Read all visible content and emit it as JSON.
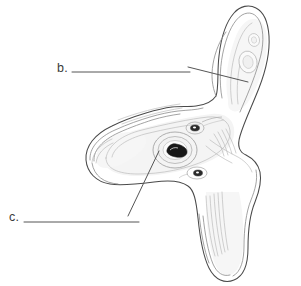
{
  "figure": {
    "type": "line-drawing",
    "background_color": "#ffffff",
    "outline_color": "#4a4a4a",
    "inner_line_color": "#8f8f8f",
    "faint_line_color": "#bdbdbd",
    "shading_color": "#f2f2f2",
    "dark_fill_color": "#1a1a1a",
    "leader_line_color": "#555555",
    "label_text_color": "#3a3a3a"
  },
  "labels": [
    {
      "id": "b",
      "text": "b.",
      "blank_rule": true,
      "rule_x_start": 72,
      "rule_x_end": 190,
      "rule_y": 72,
      "leader_from_x": 188,
      "leader_from_y": 67,
      "leader_to_x": 248,
      "leader_to_y": 82
    },
    {
      "id": "c",
      "text": "c.",
      "blank_rule": true,
      "rule_x_start": 24,
      "rule_x_end": 139,
      "rule_y": 222,
      "leader_from_x": 128,
      "leader_from_y": 216,
      "leader_to_x": 159,
      "leader_to_y": 151
    }
  ]
}
